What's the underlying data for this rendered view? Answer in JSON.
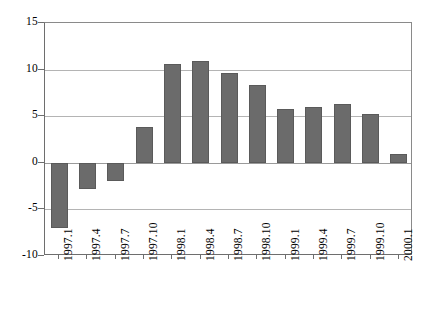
{
  "chart_data": {
    "type": "bar",
    "title": "",
    "subtitle": "",
    "xlabel": "",
    "ylabel": "",
    "legend": [],
    "grid": true,
    "legend_position": "none",
    "orientation": "vertical",
    "bar_color": "#6b6b6b",
    "bar_edge_color": "#5a5a5a",
    "axis_color": "#6e6e6e",
    "grid_color": "#b4b4b4",
    "background_color": "#ffffff",
    "ylim": [
      -10,
      15
    ],
    "yticks": [
      15,
      10,
      5,
      0,
      -5,
      -10
    ],
    "ytick_labels": [
      "15",
      "10",
      "5",
      "0",
      "-5",
      "-10"
    ],
    "categories": [
      "1997.1",
      "1997.4",
      "1997.7",
      "1997.10",
      "1998.1",
      "1998.4",
      "1998.7",
      "1998.10",
      "1999.1",
      "1999.4",
      "1999.7",
      "1999.10",
      "2000.1"
    ],
    "values": [
      -7.0,
      -2.8,
      -1.9,
      3.8,
      10.6,
      10.9,
      9.6,
      8.3,
      5.8,
      6.0,
      6.3,
      5.2,
      0.9
    ],
    "xtick_label_rotation": 90
  }
}
